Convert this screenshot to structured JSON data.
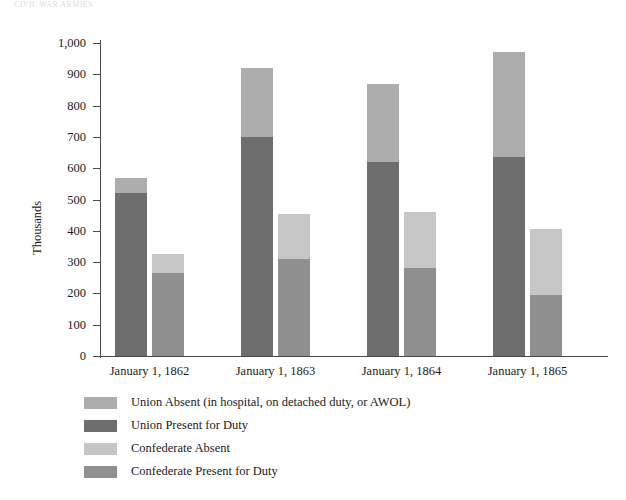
{
  "page": {
    "title_remnant": "CIVIL WAR ARMIES"
  },
  "chart_data": {
    "type": "bar",
    "stacked": true,
    "title": "",
    "xlabel": "",
    "ylabel": "Thousands",
    "ylim": [
      0,
      1000
    ],
    "ytick_step": 100,
    "grid": false,
    "legend_position": "bottom-left",
    "categories": [
      "January 1, 1862",
      "January 1, 1863",
      "January 1, 1864",
      "January 1, 1865"
    ],
    "ytick_labels": [
      "1,000",
      "900",
      "800",
      "700",
      "600",
      "500",
      "400",
      "300",
      "200",
      "100",
      "0"
    ],
    "ytick_values": [
      1000,
      900,
      800,
      700,
      600,
      500,
      400,
      300,
      200,
      100,
      0
    ],
    "series": [
      {
        "name": "Union Absent (in hospital, on detached duty, or AWOL)",
        "color": "#adadad",
        "group": "union",
        "stack_order": 2,
        "values": [
          50,
          220,
          250,
          335
        ]
      },
      {
        "name": "Union Present for Duty",
        "color": "#6e6e6e",
        "group": "union",
        "stack_order": 1,
        "values": [
          520,
          700,
          620,
          635
        ]
      },
      {
        "name": "Confederate Absent",
        "color": "#c6c6c6",
        "group": "confederate",
        "stack_order": 2,
        "values": [
          60,
          145,
          180,
          210
        ]
      },
      {
        "name": "Confederate Present for Duty",
        "color": "#8f8f8f",
        "group": "confederate",
        "stack_order": 1,
        "values": [
          265,
          310,
          280,
          195
        ]
      }
    ],
    "totals": {
      "union": [
        570,
        920,
        870,
        970
      ],
      "confederate": [
        325,
        455,
        460,
        405
      ]
    }
  },
  "legend": {
    "items": [
      {
        "label": "Union Absent (in hospital, on detached duty, or AWOL)",
        "color": "#adadad"
      },
      {
        "label": "Union Present for Duty",
        "color": "#6e6e6e"
      },
      {
        "label": "Confederate Absent",
        "color": "#c6c6c6"
      },
      {
        "label": "Confederate Present for Duty",
        "color": "#8f8f8f"
      }
    ]
  }
}
